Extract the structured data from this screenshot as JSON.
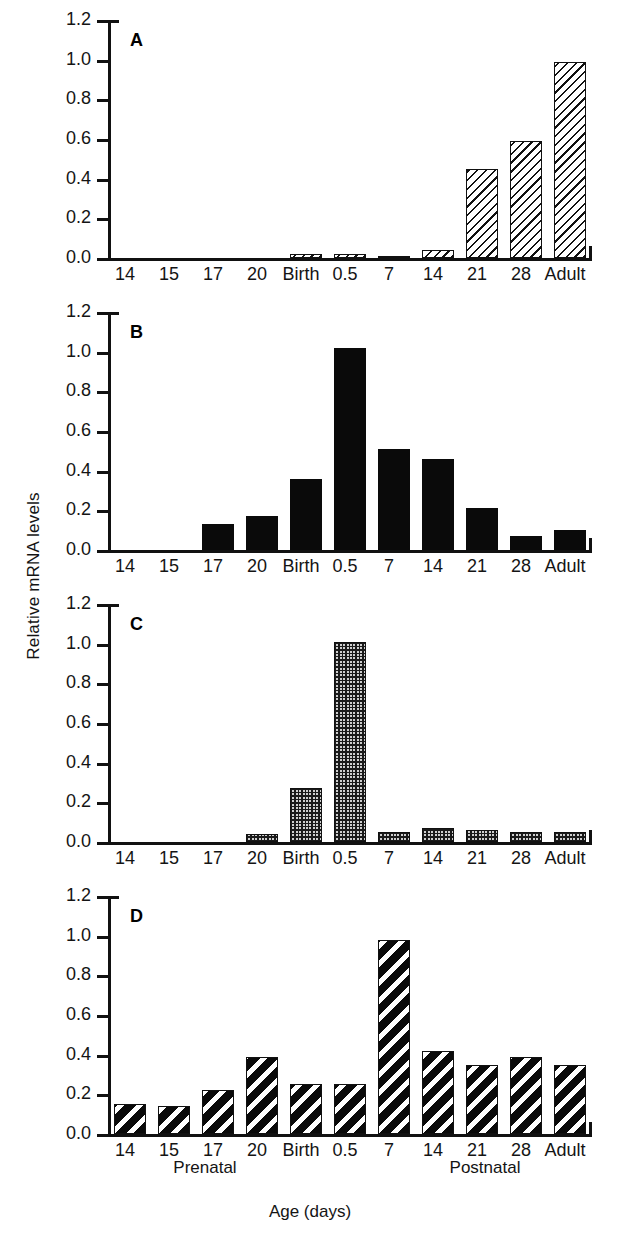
{
  "figure": {
    "ylabel": "Relative mRNA levels",
    "xtitle": "Age (days)",
    "group_labels": {
      "prenatal": "Prenatal",
      "postnatal": "Postnatal"
    }
  },
  "axis": {
    "y_ticks": [
      "1.2",
      "1.0",
      "0.8",
      "0.6",
      "0.4",
      "0.2",
      "0.0"
    ],
    "y_min": 0.0,
    "y_max": 1.2
  },
  "categories": [
    "14",
    "15",
    "17",
    "20",
    "Birth",
    "0.5",
    "7",
    "14",
    "21",
    "28",
    "Adult"
  ],
  "panels": [
    {
      "letter": "A",
      "fill": "fill-thin-hatch"
    },
    {
      "letter": "B",
      "fill": "fill-solid"
    },
    {
      "letter": "C",
      "fill": "fill-grid-dot"
    },
    {
      "letter": "D",
      "fill": "fill-bold-hatch"
    }
  ],
  "chart_data": {
    "type": "bar",
    "title": "",
    "subtitle": "",
    "xlabel": "Age (days)",
    "ylabel": "Relative mRNA levels",
    "ylim": [
      0.0,
      1.2
    ],
    "yticks": [
      0.0,
      0.2,
      0.4,
      0.6,
      0.8,
      1.0,
      1.2
    ],
    "grid": false,
    "legend": false,
    "categories": [
      "14",
      "15",
      "17",
      "20",
      "Birth",
      "0.5",
      "7",
      "14",
      "21",
      "28",
      "Adult"
    ],
    "group_spans": {
      "Prenatal": [
        "14",
        "15",
        "17",
        "20",
        "Birth"
      ],
      "Postnatal": [
        "0.5",
        "7",
        "14",
        "21",
        "28",
        "Adult"
      ]
    },
    "panels": [
      {
        "label": "A",
        "fill_style": "diagonal-hatch-light",
        "values": [
          0.0,
          0.0,
          0.0,
          0.0,
          0.02,
          0.02,
          0.01,
          0.04,
          0.45,
          0.59,
          0.99
        ]
      },
      {
        "label": "B",
        "fill_style": "solid-black",
        "values": [
          0.0,
          0.0,
          0.13,
          0.17,
          0.36,
          1.02,
          0.51,
          0.46,
          0.21,
          0.07,
          0.1
        ]
      },
      {
        "label": "C",
        "fill_style": "fine-grid-dot",
        "values": [
          0.0,
          0.0,
          0.0,
          0.04,
          0.27,
          1.01,
          0.05,
          0.07,
          0.06,
          0.05,
          0.05
        ]
      },
      {
        "label": "D",
        "fill_style": "diagonal-hatch-bold",
        "values": [
          0.15,
          0.14,
          0.22,
          0.39,
          0.25,
          0.25,
          0.98,
          0.42,
          0.35,
          0.39,
          0.35
        ]
      }
    ]
  },
  "colors": {
    "ink": "#111111",
    "background": "#ffffff"
  }
}
